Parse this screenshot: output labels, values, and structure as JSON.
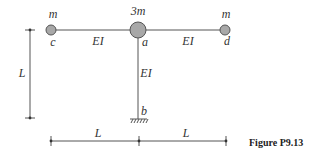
{
  "figure": {
    "caption": "Figure P9.13",
    "colors": {
      "line": "#555555",
      "mass_fill": "#a8a8a8",
      "text": "#333333"
    },
    "masses": [
      {
        "id": "c",
        "mass_label": "m",
        "node_label": "c"
      },
      {
        "id": "a",
        "mass_label": "3m",
        "node_label": "a"
      },
      {
        "id": "d",
        "mass_label": "m",
        "node_label": "d"
      }
    ],
    "members": [
      {
        "from": "c",
        "to": "a",
        "stiffness": "EI"
      },
      {
        "from": "a",
        "to": "d",
        "stiffness": "EI"
      },
      {
        "from": "a",
        "to": "b",
        "stiffness": "EI"
      }
    ],
    "support": {
      "node_label": "b",
      "type": "fixed"
    },
    "dimensions": {
      "vertical": "L",
      "horizontal_left": "L",
      "horizontal_right": "L"
    }
  }
}
